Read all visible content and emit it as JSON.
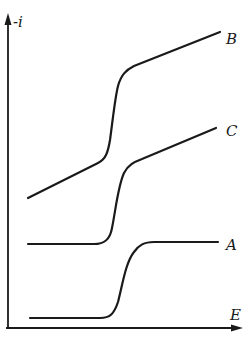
{
  "diagram": {
    "type": "current-potential curves",
    "axes": {
      "y_label": "-i",
      "x_label": "E"
    },
    "curves": [
      {
        "id": "B",
        "label": "B",
        "description": "sloped baseline, steep wave, then sloped plateau (top curve)"
      },
      {
        "id": "C",
        "label": "C",
        "description": "flat baseline, wave, then sloped plateau (middle curve)"
      },
      {
        "id": "A",
        "label": "A",
        "description": "flat baseline, wave, flat plateau (bottom curve)"
      }
    ],
    "colors": {
      "line": "#1a1a1a",
      "background": "#ffffff"
    }
  }
}
